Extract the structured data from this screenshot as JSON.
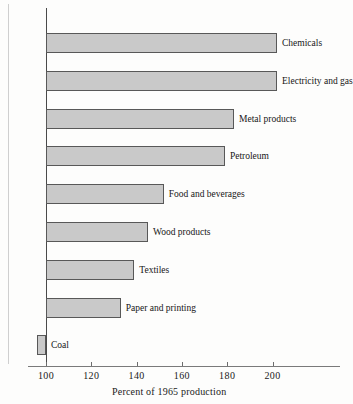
{
  "chart_data": {
    "type": "bar",
    "orientation": "horizontal",
    "title": "",
    "subtitle": "",
    "xlabel": "Percent of 1965 production",
    "ylabel": "",
    "categories": [
      "Chemicals",
      "Electricity and gas",
      "Metal products",
      "Petroleum",
      "Food and beverages",
      "Wood products",
      "Textiles",
      "Paper and printing",
      "Coal"
    ],
    "values": [
      202,
      202,
      183,
      179,
      152,
      145,
      139,
      133,
      96
    ],
    "baseline": 100,
    "xlim": [
      94,
      230
    ],
    "xticks": [
      100,
      120,
      140,
      160,
      180,
      200
    ],
    "xtick_labels": [
      "100",
      "120",
      "140",
      "160",
      "180",
      "200"
    ],
    "grid": false,
    "legend": null,
    "bar_fill_color": "#c9c9c9",
    "bar_edge_color": "#585858",
    "axis_color": "#4a4a4a"
  },
  "figure": {
    "background_color": "#fdfdfc"
  }
}
